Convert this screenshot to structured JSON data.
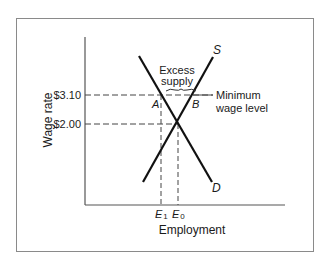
{
  "diagram": {
    "axes": {
      "y_label": "Wage rate",
      "x_label": "Employment",
      "y_ticks": [
        {
          "label": "$3.10",
          "value": 3.1
        },
        {
          "label": "$2.00",
          "value": 2.0
        }
      ],
      "x_ticks": [
        {
          "label": "E",
          "sub": "1"
        },
        {
          "label": "E",
          "sub": "0"
        }
      ]
    },
    "curves": {
      "supply": {
        "label": "S"
      },
      "demand": {
        "label": "D"
      }
    },
    "points": {
      "a": "A",
      "b": "B"
    },
    "annotations": {
      "excess_line1": "Excess",
      "excess_line2": "supply",
      "min_wage_line1": "Minimum",
      "min_wage_line2": "wage level"
    }
  }
}
